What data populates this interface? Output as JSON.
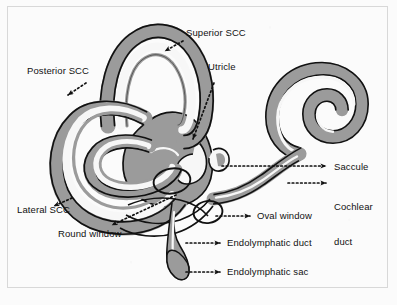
{
  "figure": {
    "background_color": "#fbfbfb",
    "frame_color": "#d8d8d8",
    "colors": {
      "bone_gray": "#9b9b9b",
      "lumen_white": "#f7f7f7",
      "outline_black": "#111111",
      "label_text": "#111111",
      "leader_line": "#111111"
    }
  },
  "labels": [
    {
      "id": "superior-scc",
      "text": "Superior SCC",
      "x": 186,
      "y": 32,
      "anchor_side": "left",
      "arrow": {
        "from": [
          183,
          41
        ],
        "to": [
          163,
          52
        ],
        "direction": "down-left",
        "style": "dotted"
      }
    },
    {
      "id": "posterior-scc",
      "text": "Posterior SCC",
      "x": 27,
      "y": 70,
      "anchor_side": "left",
      "arrow": {
        "from": [
          86,
          83
        ],
        "to": [
          66,
          96
        ],
        "direction": "down-right",
        "style": "dotted"
      }
    },
    {
      "id": "utricle",
      "text": "Utricle",
      "x": 208,
      "y": 66,
      "anchor_side": "left",
      "arrow": {
        "from": [
          214,
          82
        ],
        "to": [
          191,
          141
        ],
        "direction": "down-left",
        "style": "dotted"
      }
    },
    {
      "id": "saccule",
      "text": "Saccule",
      "x": 334,
      "y": 162,
      "anchor_side": "right",
      "arrow": {
        "from": [
          222,
          166
        ],
        "to": [
          328,
          166
        ],
        "direction": "right",
        "style": "dotted"
      }
    },
    {
      "id": "cochlear-duct",
      "text": "Cochlear\nduct",
      "line1": "Cochlear",
      "line2": "duct",
      "x": 334,
      "y": 178,
      "anchor_side": "right",
      "arrow": {
        "from": [
          287,
          183
        ],
        "to": [
          328,
          183
        ],
        "direction": "right",
        "style": "dotted"
      }
    },
    {
      "id": "oval-window",
      "text": "Oval window",
      "x": 257,
      "y": 211,
      "anchor_side": "right",
      "arrow": {
        "from": [
          218,
          216
        ],
        "to": [
          252,
          216
        ],
        "direction": "right",
        "style": "dotted"
      }
    },
    {
      "id": "lateral-scc",
      "text": "Lateral SCC",
      "x": 17,
      "y": 205,
      "anchor_side": "left",
      "arrow": {
        "from": [
          71,
          199
        ],
        "to": [
          52,
          207
        ],
        "direction": "up-left",
        "style": "dotted"
      }
    },
    {
      "id": "round-window",
      "text": "Round window",
      "x": 58,
      "y": 234,
      "anchor_side": "left",
      "arrow": {
        "from": [
          175,
          196
        ],
        "to": [
          110,
          226
        ],
        "direction": "down-left",
        "style": "dotted"
      }
    },
    {
      "id": "endolymphatic-duct",
      "text": "Endolymphatic duct",
      "x": 227,
      "y": 238,
      "anchor_side": "right",
      "arrow": {
        "from": [
          187,
          243
        ],
        "to": [
          222,
          243
        ],
        "direction": "right",
        "style": "dotted"
      }
    },
    {
      "id": "endolymphatic-sac",
      "text": "Endolymphatic sac",
      "x": 227,
      "y": 267,
      "anchor_side": "right",
      "arrow": {
        "from": [
          187,
          272
        ],
        "to": [
          222,
          272
        ],
        "direction": "right",
        "style": "dotted"
      }
    }
  ],
  "structures": [
    {
      "id": "superior-semicircular-canal",
      "name": "Superior semicircular canal"
    },
    {
      "id": "posterior-semicircular-canal",
      "name": "Posterior semicircular canal"
    },
    {
      "id": "lateral-semicircular-canal",
      "name": "Lateral semicircular canal"
    },
    {
      "id": "vestibule-utricle",
      "name": "Utricle / vestibule"
    },
    {
      "id": "saccule-body",
      "name": "Saccule"
    },
    {
      "id": "cochlea-spiral",
      "name": "Cochlea"
    },
    {
      "id": "cochlear-duct-body",
      "name": "Cochlear duct"
    },
    {
      "id": "oval-window-ring",
      "name": "Oval window"
    },
    {
      "id": "round-window-ring",
      "name": "Round window"
    },
    {
      "id": "endolymphatic-duct-body",
      "name": "Endolymphatic duct"
    },
    {
      "id": "endolymphatic-sac-body",
      "name": "Endolymphatic sac"
    }
  ]
}
